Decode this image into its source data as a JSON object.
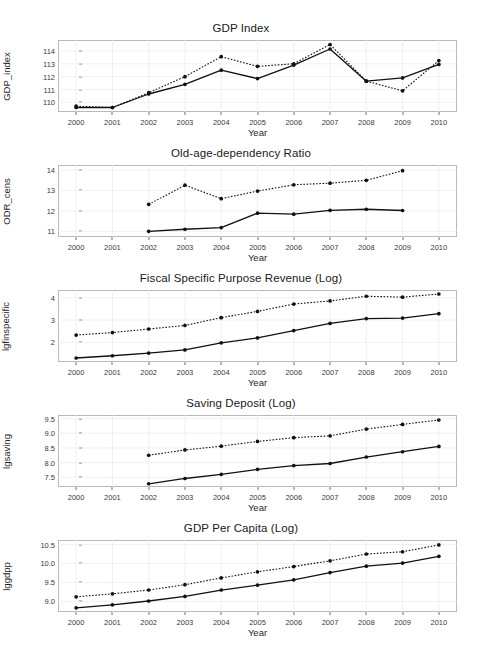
{
  "figure": {
    "xlabel": "Year",
    "years": [
      2000,
      2001,
      2002,
      2003,
      2004,
      2005,
      2006,
      2007,
      2008,
      2009,
      2010
    ]
  },
  "chart_data": [
    {
      "type": "line",
      "title": "GDP Index",
      "xlabel": "Year",
      "ylabel": "GDP_index",
      "x": [
        2000,
        2001,
        2002,
        2003,
        2004,
        2005,
        2006,
        2007,
        2008,
        2009,
        2010
      ],
      "xlim": [
        1999.5,
        2010.5
      ],
      "ylim": [
        109.25,
        114.85
      ],
      "yticks": [
        110,
        111,
        112,
        113,
        114
      ],
      "ytick_labels": [
        "110",
        "111",
        "112",
        "113",
        "114"
      ],
      "grid": true,
      "legend": "none",
      "series": [
        {
          "name": "solid",
          "style": "solid",
          "x": [
            2000,
            2001,
            2002,
            2003,
            2004,
            2005,
            2006,
            2007,
            2008,
            2009,
            2010
          ],
          "values": [
            109.6,
            109.6,
            110.65,
            111.4,
            112.5,
            111.85,
            112.9,
            114.15,
            111.65,
            111.9,
            112.95
          ]
        },
        {
          "name": "dotted",
          "style": "dotted",
          "x": [
            2000,
            2001,
            2002,
            2003,
            2004,
            2005,
            2006,
            2007,
            2008,
            2009,
            2010
          ],
          "values": [
            109.7,
            109.6,
            110.75,
            112.0,
            113.55,
            112.8,
            113.0,
            114.5,
            111.65,
            110.9,
            113.25
          ]
        }
      ]
    },
    {
      "type": "line",
      "title": "Old-age-dependency Ratio",
      "xlabel": "Year",
      "ylabel": "ODR_cens",
      "x": [
        2002,
        2003,
        2004,
        2005,
        2006,
        2007,
        2008,
        2009
      ],
      "xlim": [
        1999.5,
        2010.5
      ],
      "ylim": [
        10.72,
        14.25
      ],
      "yticks": [
        11,
        12,
        13,
        14
      ],
      "ytick_labels": [
        "11",
        "12",
        "13",
        "14"
      ],
      "grid": true,
      "legend": "none",
      "series": [
        {
          "name": "solid",
          "style": "solid",
          "x": [
            2002,
            2003,
            2004,
            2005,
            2006,
            2007,
            2008,
            2009
          ],
          "values": [
            11.0,
            11.1,
            11.18,
            11.89,
            11.84,
            12.03,
            12.08,
            12.02
          ]
        },
        {
          "name": "dotted",
          "style": "dotted",
          "x": [
            2002,
            2003,
            2004,
            2005,
            2006,
            2007,
            2008,
            2009
          ],
          "values": [
            12.32,
            13.26,
            12.6,
            12.97,
            13.28,
            13.36,
            13.5,
            13.97
          ]
        }
      ]
    },
    {
      "type": "line",
      "title": "Fiscal Specific Purpose Revenue (Log)",
      "xlabel": "Year",
      "ylabel": "lgfinspecific",
      "x": [
        2000,
        2001,
        2002,
        2003,
        2004,
        2005,
        2006,
        2007,
        2008,
        2009,
        2010
      ],
      "xlim": [
        1999.5,
        2010.5
      ],
      "ylim": [
        1.12,
        4.35
      ],
      "yticks": [
        2,
        3,
        4
      ],
      "ytick_labels": [
        "2",
        "3",
        "4"
      ],
      "grid": true,
      "legend": "none",
      "series": [
        {
          "name": "solid",
          "style": "solid",
          "x": [
            2000,
            2001,
            2002,
            2003,
            2004,
            2005,
            2006,
            2007,
            2008,
            2009,
            2010
          ],
          "values": [
            1.3,
            1.4,
            1.52,
            1.66,
            1.98,
            2.2,
            2.53,
            2.85,
            3.07,
            3.09,
            3.29
          ]
        },
        {
          "name": "dotted",
          "style": "dotted",
          "x": [
            2000,
            2001,
            2002,
            2003,
            2004,
            2005,
            2006,
            2007,
            2008,
            2009,
            2010
          ],
          "values": [
            2.33,
            2.44,
            2.6,
            2.76,
            3.11,
            3.39,
            3.72,
            3.86,
            4.07,
            4.03,
            4.17
          ]
        }
      ]
    },
    {
      "type": "line",
      "title": "Saving Deposit (Log)",
      "xlabel": "Year",
      "ylabel": "lgsaving",
      "x": [
        2002,
        2003,
        2004,
        2005,
        2006,
        2007,
        2008,
        2009,
        2010
      ],
      "xlim": [
        1999.5,
        2010.5
      ],
      "ylim": [
        7.17,
        9.62
      ],
      "yticks": [
        7.5,
        8.0,
        8.5,
        9.0,
        9.5
      ],
      "ytick_labels": [
        "7.5",
        "8.0",
        "8.5",
        "9.0",
        "9.5"
      ],
      "grid": true,
      "legend": "none",
      "series": [
        {
          "name": "solid",
          "style": "solid",
          "x": [
            2002,
            2003,
            2004,
            2005,
            2006,
            2007,
            2008,
            2009,
            2010
          ],
          "values": [
            7.28,
            7.46,
            7.6,
            7.77,
            7.9,
            7.97,
            8.19,
            8.37,
            8.55
          ]
        },
        {
          "name": "dotted",
          "style": "dotted",
          "x": [
            2002,
            2003,
            2004,
            2005,
            2006,
            2007,
            2008,
            2009,
            2010
          ],
          "values": [
            8.25,
            8.43,
            8.56,
            8.72,
            8.85,
            8.91,
            9.14,
            9.3,
            9.45
          ]
        }
      ]
    },
    {
      "type": "line",
      "title": "GDP Per Capita (Log)",
      "xlabel": "Year",
      "ylabel": "lggdpp",
      "x": [
        2000,
        2001,
        2002,
        2003,
        2004,
        2005,
        2006,
        2007,
        2008,
        2009,
        2010
      ],
      "xlim": [
        1999.5,
        2010.5
      ],
      "ylim": [
        8.72,
        10.62
      ],
      "yticks": [
        9.0,
        9.5,
        10.0,
        10.5
      ],
      "ytick_labels": [
        "9.0",
        "9.5",
        "10.0",
        "10.5"
      ],
      "grid": true,
      "legend": "none",
      "series": [
        {
          "name": "solid",
          "style": "solid",
          "x": [
            2000,
            2001,
            2002,
            2003,
            2004,
            2005,
            2006,
            2007,
            2008,
            2009,
            2010
          ],
          "values": [
            8.83,
            8.91,
            9.01,
            9.13,
            9.3,
            9.43,
            9.57,
            9.76,
            9.93,
            10.01,
            10.19
          ]
        },
        {
          "name": "dotted",
          "style": "dotted",
          "x": [
            2000,
            2001,
            2002,
            2003,
            2004,
            2005,
            2006,
            2007,
            2008,
            2009,
            2010
          ],
          "values": [
            9.12,
            9.2,
            9.3,
            9.44,
            9.62,
            9.78,
            9.92,
            10.07,
            10.25,
            10.31,
            10.49
          ]
        }
      ]
    }
  ]
}
